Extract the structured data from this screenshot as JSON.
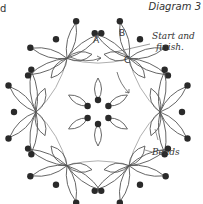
{
  "diagram": {
    "title": "Diagram 3",
    "corner_fragment": "d",
    "labels": {
      "ring_a": "A",
      "ring_b": "B",
      "ring_c": "C",
      "start_finish_line1": "Start and",
      "start_finish_line2": "finish.",
      "beads": "Beads"
    },
    "structure": {
      "outer_clusters": 6,
      "center_rings": 6,
      "center_beads": 6
    },
    "colors": {
      "line": "#555555",
      "light_line": "#9a9a9a",
      "bead": "#2a2a2a",
      "text": "#333333",
      "background": "#ffffff"
    }
  }
}
